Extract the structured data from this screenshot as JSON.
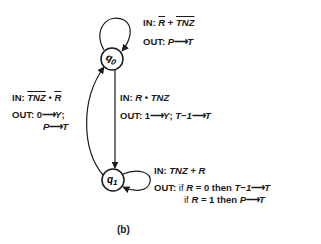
{
  "diagram": {
    "caption": "(b)",
    "states": [
      {
        "id": "q0",
        "label": "q",
        "subscript": "0"
      },
      {
        "id": "q1",
        "label": "q",
        "subscript": "1"
      }
    ],
    "transitions": {
      "q0_self": {
        "in_prefix": "IN:",
        "in_term1": "R",
        "in_op": " + ",
        "in_term2": "TNZ",
        "out_prefix": "OUT:",
        "out_from": "P",
        "out_arrow": "⟶",
        "out_to": "T"
      },
      "q0_to_q1": {
        "in_prefix": "IN:",
        "in_term1": "R",
        "in_op": " • ",
        "in_term2": "TNZ",
        "out_prefix": "OUT:",
        "out_a_from": "1",
        "out_a_arrow": "⟶",
        "out_a_to": "Y",
        "out_sep": "; ",
        "out_b_from": "T−1",
        "out_b_arrow": "⟶",
        "out_b_to": "T"
      },
      "q1_to_q0": {
        "in_prefix": "IN:",
        "in_term1": "TNZ",
        "in_op": " • ",
        "in_term2": "R",
        "out_prefix": "OUT:",
        "out_a_from": "0",
        "out_a_arrow": "⟶",
        "out_a_to": "Y",
        "out_sep": ";",
        "out_b_from": "P",
        "out_b_arrow": "⟶",
        "out_b_to": "T"
      },
      "q1_self": {
        "in_prefix": "IN:",
        "in_term1": "TNZ",
        "in_op": " + ",
        "in_term2": "R",
        "out_prefix": "OUT:",
        "line1_if": "if ",
        "line1_var": "R",
        "line1_cond": " = 0 then ",
        "line1_from": "T−1",
        "line1_arrow": "⟶",
        "line1_to": "T",
        "line2_if": "if ",
        "line2_var": "R",
        "line2_cond": " = 1 then ",
        "line2_from": "P",
        "line2_arrow": "⟶",
        "line2_to": "T"
      }
    }
  }
}
